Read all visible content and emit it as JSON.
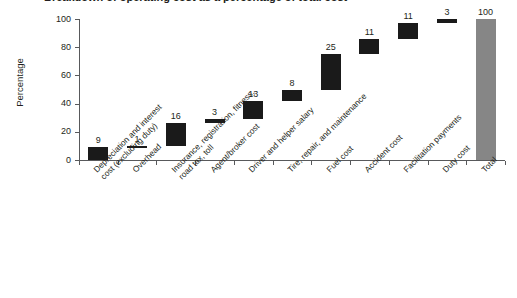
{
  "figure": {
    "title_fragment": "Breakdown of operating cost as a percentage of total cost",
    "y_axis_title": "Percentage",
    "y_ticks": [
      "0",
      "20",
      "40",
      "60",
      "80",
      "100"
    ],
    "colors": {
      "increment": "#1a1a1a",
      "total": "#868686",
      "axis": "#58595b",
      "text": "#231f20",
      "background": "#ffffff"
    }
  },
  "chart_data": {
    "type": "bar",
    "subtype": "waterfall",
    "title": "Breakdown of operating cost as a percentage of total cost",
    "xlabel": "",
    "ylabel": "Percentage",
    "ylim": [
      0,
      100
    ],
    "yticks": [
      0,
      20,
      40,
      60,
      80,
      100
    ],
    "grid": false,
    "legend": "none",
    "categories": [
      "Depreciation and interest cost (excluding duty)",
      "Overhead",
      "Insurance, registration, fitness, road tax, toll",
      "Agent/broker cost",
      "Driver and helper salary",
      "Tire, repair, and maintenance",
      "Fuel cost",
      "Accident cost",
      "Facilitation payments",
      "Duty cost",
      "Total"
    ],
    "category_lines": [
      [
        "Depreciation and interest",
        "cost (excluding duty)"
      ],
      [
        "Overhead"
      ],
      [
        "Insurance, registration, fitness,",
        "road tax, toll"
      ],
      [
        "Agent/broker cost"
      ],
      [
        "Driver and helper salary"
      ],
      [
        "Tire, repair, and maintenance"
      ],
      [
        "Fuel cost"
      ],
      [
        "Accident cost"
      ],
      [
        "Facilitation payments"
      ],
      [
        "Duty cost"
      ],
      [
        "Total"
      ]
    ],
    "values": [
      9,
      1,
      16,
      3,
      13,
      8,
      25,
      11,
      11,
      3,
      100
    ],
    "value_labels": [
      "9",
      "1",
      "16",
      "3",
      "13",
      "8",
      "25",
      "11",
      "11",
      "3",
      "100"
    ],
    "cumulative_start": [
      0,
      9,
      10,
      26,
      29,
      42,
      50,
      75,
      86,
      97,
      0
    ],
    "cumulative_end": [
      9,
      10,
      26,
      29,
      42,
      50,
      75,
      86,
      97,
      100,
      100
    ],
    "bar_kind": [
      "increment",
      "increment",
      "increment",
      "increment",
      "increment",
      "increment",
      "increment",
      "increment",
      "increment",
      "increment",
      "total"
    ]
  }
}
